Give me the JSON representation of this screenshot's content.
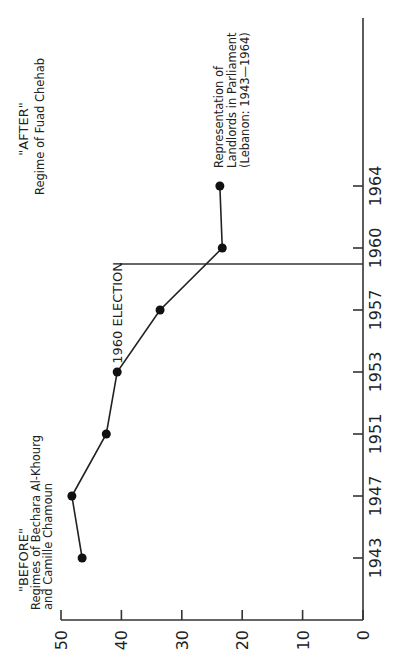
{
  "chart_data": {
    "type": "line",
    "orientation": "rotated-90-ccw",
    "title": "",
    "xlabel": "",
    "ylabel": "",
    "categories": [
      "1943",
      "1947",
      "1951",
      "1953",
      "1957",
      "1960",
      "1964"
    ],
    "series": [
      {
        "name": "Representation of Landlords in Parliament (Lebanon: 1943-1964)",
        "values": [
          46.5,
          48.2,
          42.5,
          40.7,
          33.6,
          23.3,
          23.7
        ]
      }
    ],
    "y_ticks": [
      "0",
      "10",
      "20",
      "30",
      "40",
      "50"
    ],
    "ylim": [
      0,
      50
    ],
    "grid": false,
    "annotations": {
      "election_line_label": "1960 ELECTION",
      "before_title": "\"BEFORE\"",
      "before_line1": "Regimes of Bechara Al-Khourg",
      "before_line2": "and Camille Chamoun",
      "after_title": "\"AFTER\"",
      "after_line1": "Regime of Fuad Chehab",
      "series_label_line1": "Representation of",
      "series_label_line2": "Landlords in Parliament",
      "series_label_line3": "(Lebanon: 1943—1964)"
    },
    "colors": {
      "line": "#222222",
      "marker": "#111111",
      "axis": "#333333"
    }
  }
}
